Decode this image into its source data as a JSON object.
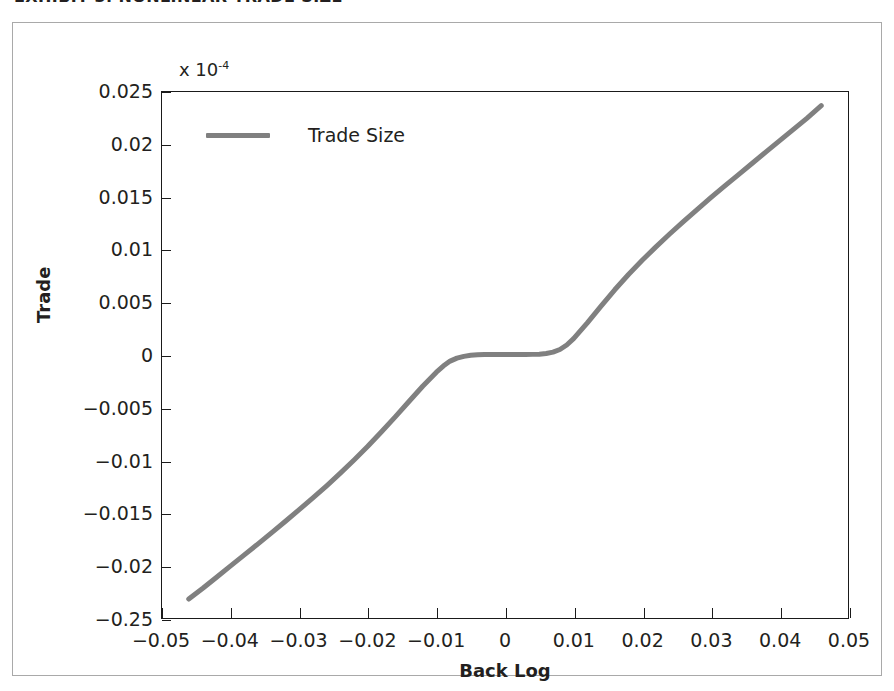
{
  "caption": {
    "text": "EXHIBIT 3.  NONLINEAR TRADE SIZE"
  },
  "colors": {
    "curve": "#808080",
    "axis": "#1a1a1a",
    "frame": "#a9a9a9",
    "text": "#231f20",
    "background": "#ffffff"
  },
  "legend": {
    "entries": [
      {
        "label": "Trade Size",
        "color": "#808080"
      }
    ]
  },
  "axis_multiplier": {
    "prefix": "x 10",
    "exponent": "-4"
  },
  "chart_data": {
    "type": "line",
    "title": "",
    "subtitle": "",
    "xlabel": "Back Log",
    "ylabel": "Trade",
    "y_multiplier_text": "x 10^-4",
    "xlim": [
      -0.05,
      0.05
    ],
    "ylim": [
      -0.025,
      0.025
    ],
    "grid": false,
    "legend_position": "top-left",
    "xticks": [
      -0.05,
      -0.04,
      -0.03,
      -0.02,
      -0.01,
      0,
      0.01,
      0.02,
      0.03,
      0.04,
      0.05
    ],
    "xticklabels": [
      "−0.05",
      "−0.04",
      "−0.03",
      "−0.02",
      "−0.01",
      "0",
      "0.01",
      "0.02",
      "0.03",
      "0.04",
      "0.05"
    ],
    "yticks": [
      0.025,
      0.02,
      0.015,
      0.01,
      0.005,
      0,
      -0.005,
      -0.01,
      -0.015,
      -0.02,
      -0.025
    ],
    "yticklabels": [
      "0.025",
      "0.02",
      "0.015",
      "0.01",
      "0.005",
      "0",
      "−0.005",
      "−0.01",
      "−0.015",
      "−0.02",
      "−0.25"
    ],
    "series": [
      {
        "name": "Trade Size",
        "color": "#808080",
        "linewidth": 5,
        "x": [
          -0.0461,
          -0.044,
          -0.042,
          -0.04,
          -0.038,
          -0.036,
          -0.034,
          -0.032,
          -0.03,
          -0.028,
          -0.026,
          -0.024,
          -0.022,
          -0.02,
          -0.018,
          -0.016,
          -0.014,
          -0.012,
          -0.01,
          -0.009,
          -0.008,
          -0.007,
          -0.006,
          -0.005,
          -0.004,
          -0.003,
          -0.002,
          -0.001,
          0.0,
          0.001,
          0.002,
          0.003,
          0.004,
          0.005,
          0.006,
          0.007,
          0.008,
          0.009,
          0.01,
          0.012,
          0.014,
          0.016,
          0.018,
          0.02,
          0.022,
          0.024,
          0.026,
          0.028,
          0.03,
          0.032,
          0.034,
          0.036,
          0.038,
          0.04,
          0.042,
          0.044,
          0.0461
        ],
        "y": [
          -0.0232,
          -0.02215,
          -0.0211,
          -0.02005,
          -0.019,
          -0.01795,
          -0.01688,
          -0.0158,
          -0.0147,
          -0.01358,
          -0.01243,
          -0.01123,
          -0.00998,
          -0.00868,
          -0.0073,
          -0.00588,
          -0.00442,
          -0.00297,
          -0.00163,
          -0.00105,
          -0.00058,
          -0.0003,
          -0.00013,
          -3e-05,
          2e-05,
          4e-05,
          5e-05,
          5e-05,
          5e-05,
          5e-05,
          5e-05,
          5e-05,
          6e-05,
          8e-05,
          0.00014,
          0.00027,
          0.00052,
          0.00095,
          0.00155,
          0.00305,
          0.00465,
          0.0062,
          0.00765,
          0.009,
          0.01028,
          0.0115,
          0.01268,
          0.01383,
          0.01495,
          0.01605,
          0.01713,
          0.0182,
          0.01928,
          0.02035,
          0.02143,
          0.0225,
          0.0237
        ]
      }
    ]
  }
}
